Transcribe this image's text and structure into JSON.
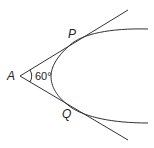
{
  "diagram": {
    "labels": {
      "vertex": "A",
      "upper_tangent_point": "P",
      "lower_tangent_point": "Q",
      "angle": "60°"
    },
    "colors": {
      "stroke": "#333333",
      "text": "#222222"
    }
  }
}
